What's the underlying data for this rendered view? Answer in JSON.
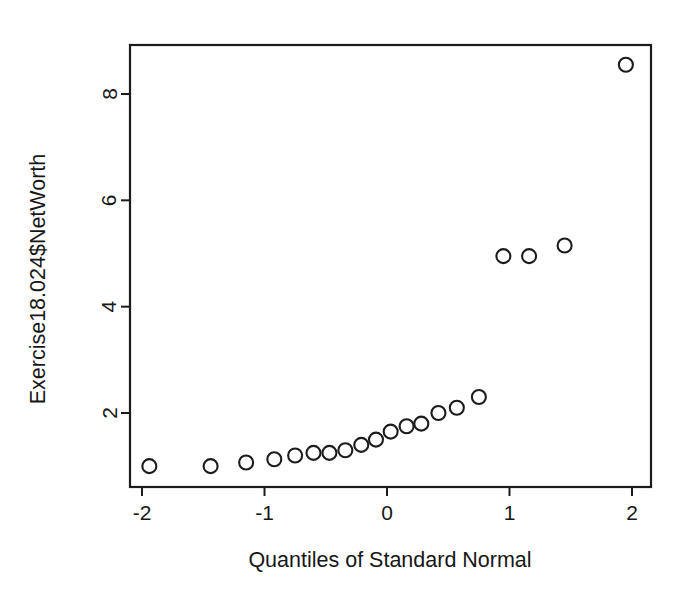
{
  "chart_data": {
    "type": "scatter",
    "title": "",
    "subtitle": "",
    "xlabel": "Quantiles of Standard Normal",
    "ylabel": "Exercise18.024$NetWorth",
    "xlim": [
      -2.18,
      2.18
    ],
    "ylim": [
      0.65,
      8.95
    ],
    "xticks": [
      -2,
      -1,
      0,
      1,
      2
    ],
    "xticklabels": [
      "-2",
      "-1",
      "0",
      "1",
      "2"
    ],
    "yticks": [
      2,
      4,
      6,
      8
    ],
    "yticklabels": [
      "2",
      "4",
      "6",
      "8"
    ],
    "grid": false,
    "legend": false,
    "legend_position": "none",
    "marker": "open-circle",
    "marker_color": "#1c1c1c",
    "marker_radius_px": 7,
    "frame": "box",
    "n_points": 20,
    "x": [
      -1.94,
      -1.44,
      -1.15,
      -0.92,
      -0.75,
      -0.6,
      -0.47,
      -0.34,
      -0.21,
      -0.09,
      0.03,
      0.16,
      0.28,
      0.42,
      0.57,
      0.75,
      0.95,
      1.16,
      1.45,
      1.95
    ],
    "y": [
      1.0,
      1.0,
      1.07,
      1.13,
      1.2,
      1.25,
      1.25,
      1.3,
      1.4,
      1.5,
      1.65,
      1.75,
      1.8,
      2.0,
      2.1,
      2.3,
      4.95,
      4.95,
      5.15,
      8.55
    ],
    "points": [
      {
        "x": -1.94,
        "y": 1.0
      },
      {
        "x": -1.44,
        "y": 1.0
      },
      {
        "x": -1.15,
        "y": 1.07
      },
      {
        "x": -0.92,
        "y": 1.13
      },
      {
        "x": -0.75,
        "y": 1.2
      },
      {
        "x": -0.6,
        "y": 1.25
      },
      {
        "x": -0.47,
        "y": 1.25
      },
      {
        "x": -0.34,
        "y": 1.3
      },
      {
        "x": -0.21,
        "y": 1.4
      },
      {
        "x": -0.09,
        "y": 1.5
      },
      {
        "x": 0.03,
        "y": 1.65
      },
      {
        "x": 0.16,
        "y": 1.75
      },
      {
        "x": 0.28,
        "y": 1.8
      },
      {
        "x": 0.42,
        "y": 2.0
      },
      {
        "x": 0.57,
        "y": 2.1
      },
      {
        "x": 0.75,
        "y": 2.3
      },
      {
        "x": 0.95,
        "y": 4.95
      },
      {
        "x": 1.16,
        "y": 4.95
      },
      {
        "x": 1.45,
        "y": 5.15
      },
      {
        "x": 1.95,
        "y": 8.55
      }
    ]
  },
  "axes": {
    "x_title": "Quantiles of Standard Normal",
    "y_title": "Exercise18.024$NetWorth",
    "x_tick_labels": [
      "-2",
      "-1",
      "0",
      "1",
      "2"
    ],
    "y_tick_labels": [
      "2",
      "4",
      "6",
      "8"
    ]
  },
  "colors": {
    "ink": "#1c1c1c",
    "background": "#ffffff"
  }
}
